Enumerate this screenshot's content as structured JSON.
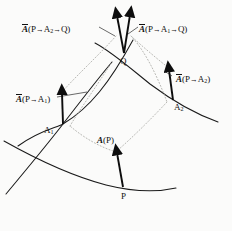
{
  "figure": {
    "background_color": "#fbfbfa",
    "curve_color": "#1a1a1a",
    "dotted_color": "#b0b0ac",
    "arrow_color": "#0d0d0d",
    "text_color": "#111111"
  },
  "points": [
    {
      "id": "P",
      "label": "P",
      "x": 123,
      "y": 187,
      "label_x": 121,
      "label_y": 192
    },
    {
      "id": "A1",
      "label_base": "A",
      "label_sub": "1",
      "x": 63,
      "y": 124,
      "label_x": 44,
      "label_y": 126
    },
    {
      "id": "A2",
      "label_base": "A",
      "label_sub": "2",
      "x": 173,
      "y": 100,
      "label_x": 174,
      "label_y": 103
    },
    {
      "id": "Q",
      "label": "Q",
      "x": 124,
      "y": 53,
      "label_x": 120,
      "label_y": 57
    }
  ],
  "vectors": [
    {
      "id": "A-at-P",
      "label_parts": {
        "overbar": false,
        "base": "A",
        "args": "(P)"
      },
      "label_plain": "A(P)",
      "from_x": 123,
      "from_y": 187,
      "to_x": 116,
      "to_y": 150,
      "label_x": 97,
      "label_y": 136
    },
    {
      "id": "A-transported-to-A1",
      "label_parts": {
        "overbar": true,
        "base": "A",
        "args": "(P→A1)"
      },
      "label_plain": "A̅(P→A₁)",
      "from_x": 63,
      "from_y": 124,
      "to_x": 62,
      "to_y": 90,
      "label_x": 16,
      "label_y": 94
    },
    {
      "id": "A-transported-to-A2",
      "label_parts": {
        "overbar": true,
        "base": "A",
        "args": "(P→A2)"
      },
      "label_plain": "A̅(P→A₂)",
      "from_x": 173,
      "from_y": 100,
      "to_x": 169,
      "to_y": 67,
      "label_x": 176,
      "label_y": 74
    },
    {
      "id": "A-transported-via-A2-to-Q",
      "label_parts": {
        "overbar": true,
        "base": "A",
        "args": "(P→A2→Q)"
      },
      "label_plain": "A̅(P→A₂→Q)",
      "from_x": 124,
      "from_y": 53,
      "to_x": 116,
      "to_y": 13,
      "label_x": 22,
      "label_y": 24
    },
    {
      "id": "A-transported-via-A1-to-Q",
      "label_parts": {
        "overbar": true,
        "base": "A",
        "args": "(P→A1→Q)"
      },
      "label_plain": "A̅(P→A₁→Q)",
      "from_x": 124,
      "from_y": 53,
      "to_x": 131,
      "to_y": 12,
      "label_x": 139,
      "label_y": 24
    }
  ],
  "curves": [
    {
      "id": "curve-P-A1-extended",
      "desc": "coordinate curve through P and A1"
    },
    {
      "id": "curve-P-A2-extended",
      "desc": "coordinate curve through P and A2"
    },
    {
      "id": "curve-A1-Q-extended",
      "desc": "coordinate curve through A1 and Q"
    },
    {
      "id": "curve-A2-Q-extended",
      "desc": "coordinate curve through A2 and Q"
    }
  ],
  "dotted_guides": [
    {
      "id": "guide-A1tip-to-Q",
      "desc": "dotted transport guide from A1 vector tip toward Q"
    },
    {
      "id": "guide-A2tip-to-Q",
      "desc": "dotted transport guide from A2 vector tip toward Q"
    },
    {
      "id": "guide-Ptip-to-A1",
      "desc": "dotted transport guide from A(P) tip toward A1"
    },
    {
      "id": "guide-Ptip-to-A2",
      "desc": "dotted transport guide from A(P) tip toward A2"
    }
  ],
  "leader_lines": [
    {
      "id": "leader-left-top",
      "from_x": 98,
      "from_y": 26,
      "to_x": 114,
      "to_y": 34
    },
    {
      "id": "leader-right-top",
      "from_x": 137,
      "from_y": 26,
      "to_x": 127,
      "to_y": 33
    }
  ]
}
